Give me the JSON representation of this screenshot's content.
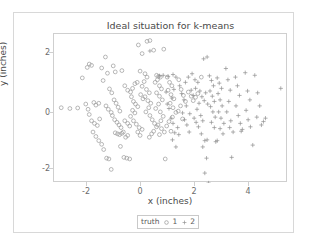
{
  "chart_data": {
    "type": "scatter",
    "title": "Ideal situation for k-means",
    "xlabel": "x (inches)",
    "ylabel": "y (inches)",
    "xlim": [
      -2.6,
      5.5
    ],
    "ylim": [
      -3.0,
      2.7
    ],
    "xticks": [
      -2,
      0,
      2,
      4
    ],
    "xtick_labels": [
      "-2",
      "0",
      "2",
      "4"
    ],
    "yticks": [
      -2,
      0,
      2
    ],
    "ytick_labels": [
      "-2",
      "0",
      "2"
    ],
    "grid": false,
    "legend": {
      "title": "truth",
      "position": "bottom",
      "entries": [
        {
          "label": "1",
          "marker": "open-circle",
          "color": "#8a8a8a"
        },
        {
          "label": "2",
          "marker": "plus",
          "color": "#8a8a8a"
        }
      ]
    },
    "series": [
      {
        "name": "1",
        "marker": "open-circle",
        "color": "#9a9a9a",
        "points": [
          [
            -2.35,
            -0.12
          ],
          [
            -2.05,
            -0.15
          ],
          [
            -1.78,
            -0.13
          ],
          [
            -1.62,
            1.02
          ],
          [
            -1.45,
            1.42
          ],
          [
            -1.38,
            1.55
          ],
          [
            -1.3,
            1.5
          ],
          [
            -1.22,
            0.08
          ],
          [
            -1.15,
            -0.02
          ],
          [
            -1.05,
            0.05
          ],
          [
            -1.38,
            -0.38
          ],
          [
            -1.3,
            -0.62
          ],
          [
            -1.2,
            -0.72
          ],
          [
            -1.1,
            -0.8
          ],
          [
            -1.02,
            -0.55
          ],
          [
            -1.25,
            -1.05
          ],
          [
            -1.15,
            -1.22
          ],
          [
            -1.05,
            -1.38
          ],
          [
            -0.95,
            -1.52
          ],
          [
            -0.88,
            -1.72
          ],
          [
            -0.78,
            -2.05
          ],
          [
            -0.7,
            -2.08
          ],
          [
            -0.62,
            -2.48
          ],
          [
            -0.95,
            1.4
          ],
          [
            -0.82,
            1.82
          ],
          [
            -0.75,
            1.2
          ],
          [
            -0.68,
            0.6
          ],
          [
            -0.6,
            0.45
          ],
          [
            -0.52,
            0.18
          ],
          [
            -0.45,
            0.05
          ],
          [
            -0.38,
            -0.1
          ],
          [
            -0.32,
            -0.25
          ],
          [
            -0.58,
            -0.42
          ],
          [
            -0.5,
            -0.58
          ],
          [
            -0.42,
            -0.68
          ],
          [
            -0.35,
            -0.78
          ],
          [
            -0.28,
            -0.88
          ],
          [
            -0.48,
            -1.08
          ],
          [
            -0.4,
            -1.12
          ],
          [
            -0.33,
            -1.15
          ],
          [
            -0.25,
            -1.1
          ],
          [
            -0.2,
            -1.05
          ],
          [
            -0.3,
            -1.6
          ],
          [
            -0.18,
            -2.02
          ],
          [
            -0.08,
            -2.05
          ],
          [
            0.02,
            -2.08
          ],
          [
            -0.25,
            1.3
          ],
          [
            -0.15,
            0.72
          ],
          [
            -0.05,
            0.55
          ],
          [
            0.05,
            0.48
          ],
          [
            0.12,
            0.62
          ],
          [
            0.2,
            0.8
          ],
          [
            0.28,
            0.85
          ],
          [
            0.08,
            0.3
          ],
          [
            0.15,
            0.12
          ],
          [
            0.22,
            0.02
          ],
          [
            0.3,
            -0.08
          ],
          [
            0.12,
            -0.22
          ],
          [
            0.2,
            -0.32
          ],
          [
            0.05,
            -0.45
          ],
          [
            0.15,
            -0.62
          ],
          [
            0.25,
            -0.75
          ],
          [
            0.35,
            -0.88
          ],
          [
            0.3,
            -1.05
          ],
          [
            0.38,
            -1.18
          ],
          [
            0.45,
            -0.95
          ],
          [
            0.32,
            2.28
          ],
          [
            0.45,
            1.95
          ],
          [
            0.55,
            1.18
          ],
          [
            0.62,
            1.05
          ],
          [
            0.52,
            0.88
          ],
          [
            0.45,
            0.7
          ],
          [
            0.6,
            0.58
          ],
          [
            0.7,
            0.45
          ],
          [
            0.55,
            0.3
          ],
          [
            0.65,
            0.15
          ],
          [
            0.75,
            0.05
          ],
          [
            0.68,
            -0.12
          ],
          [
            0.58,
            -0.28
          ],
          [
            0.72,
            -0.42
          ],
          [
            0.8,
            -0.58
          ],
          [
            0.88,
            -0.72
          ],
          [
            0.95,
            -0.85
          ],
          [
            0.85,
            -1.02
          ],
          [
            0.78,
            -1.12
          ],
          [
            0.7,
            -1.25
          ],
          [
            0.62,
            2.42
          ],
          [
            0.72,
            2.45
          ],
          [
            0.85,
            2.08
          ],
          [
            0.95,
            1.12
          ],
          [
            1.02,
            1.08
          ],
          [
            1.08,
            1.05
          ],
          [
            0.98,
            0.95
          ],
          [
            0.9,
            0.85
          ],
          [
            1.05,
            0.72
          ],
          [
            1.12,
            0.6
          ],
          [
            0.95,
            0.45
          ],
          [
            1.05,
            0.32
          ],
          [
            1.15,
            0.18
          ],
          [
            1.02,
            0.02
          ],
          [
            0.92,
            -0.15
          ],
          [
            1.08,
            -0.28
          ],
          [
            1.18,
            -0.45
          ],
          [
            1.1,
            -0.62
          ],
          [
            1.0,
            -0.78
          ],
          [
            1.12,
            -0.92
          ],
          [
            1.22,
            -1.05
          ],
          [
            1.05,
            -1.15
          ],
          [
            1.2,
            2.12
          ],
          [
            1.32,
            1.05
          ],
          [
            1.4,
            0.85
          ],
          [
            1.48,
            0.72
          ],
          [
            1.35,
            0.55
          ],
          [
            1.45,
            0.38
          ],
          [
            1.55,
            0.22
          ],
          [
            1.42,
            0.05
          ],
          [
            1.52,
            -0.12
          ],
          [
            1.62,
            -0.3
          ],
          [
            1.5,
            -0.48
          ],
          [
            1.38,
            -0.65
          ],
          [
            1.3,
            -0.82
          ],
          [
            1.45,
            -1.02
          ],
          [
            1.25,
            -2.08
          ],
          [
            1.72,
            0.95
          ],
          [
            1.8,
            0.58
          ],
          [
            1.88,
            0.35
          ],
          [
            1.95,
            0.12
          ],
          [
            1.78,
            -0.05
          ],
          [
            1.7,
            -0.25
          ],
          [
            1.85,
            -0.55
          ],
          [
            2.05,
            0.48
          ],
          [
            2.15,
            0.32
          ],
          [
            2.22,
            0.15
          ],
          [
            2.3,
            0.28
          ],
          [
            2.38,
            0.42
          ],
          [
            2.5,
            1.05
          ],
          [
            -1.5,
            0.02
          ],
          [
            -1.42,
            -0.18
          ],
          [
            -0.9,
            0.92
          ],
          [
            -0.8,
            -0.05
          ],
          [
            -0.72,
            -0.18
          ],
          [
            -0.62,
            -0.3
          ],
          [
            -0.55,
            1.48
          ],
          [
            -0.48,
            1.25
          ],
          [
            0.4,
            0.38
          ],
          [
            0.48,
            0.22
          ],
          [
            0.38,
            1.28
          ],
          [
            -0.15,
            -0.62
          ],
          [
            -0.05,
            -0.72
          ],
          [
            0.02,
            -0.82
          ],
          [
            -0.12,
            -1.25
          ],
          [
            -0.05,
            -1.18
          ]
        ]
      },
      {
        "name": "2",
        "marker": "plus",
        "color": "#8f8f8f",
        "points": [
          [
            0.72,
            2.05
          ],
          [
            1.05,
            1.1
          ],
          [
            1.18,
            1.12
          ],
          [
            1.35,
            1.08
          ],
          [
            1.52,
            1.15
          ],
          [
            1.62,
            1.05
          ],
          [
            1.55,
            0.58
          ],
          [
            1.48,
            0.25
          ],
          [
            1.38,
            -0.15
          ],
          [
            1.45,
            -0.52
          ],
          [
            1.52,
            -0.72
          ],
          [
            1.58,
            -1.08
          ],
          [
            1.5,
            -1.35
          ],
          [
            1.62,
            -1.62
          ],
          [
            1.75,
            0.72
          ],
          [
            1.82,
            0.42
          ],
          [
            1.9,
            0.18
          ],
          [
            1.98,
            -0.05
          ],
          [
            1.85,
            -0.32
          ],
          [
            1.92,
            -0.58
          ],
          [
            2.0,
            -0.78
          ],
          [
            2.08,
            -1.05
          ],
          [
            2.15,
            0.55
          ],
          [
            2.22,
            0.35
          ],
          [
            2.3,
            0.62
          ],
          [
            2.38,
            0.85
          ],
          [
            2.45,
            0.52
          ],
          [
            2.52,
            0.3
          ],
          [
            2.42,
            0.05
          ],
          [
            2.35,
            -0.18
          ],
          [
            2.48,
            -0.42
          ],
          [
            2.55,
            -0.62
          ],
          [
            2.4,
            -0.85
          ],
          [
            2.5,
            -1.12
          ],
          [
            2.62,
            -1.38
          ],
          [
            2.7,
            -1.35
          ],
          [
            2.55,
            -1.62
          ],
          [
            2.68,
            -2.05
          ],
          [
            2.62,
            -2.62
          ],
          [
            2.75,
            -3.0
          ],
          [
            2.58,
            1.75
          ],
          [
            2.7,
            1.82
          ],
          [
            2.78,
            1.1
          ],
          [
            2.85,
            0.92
          ],
          [
            2.92,
            0.72
          ],
          [
            2.8,
            0.52
          ],
          [
            2.88,
            0.32
          ],
          [
            2.95,
            0.12
          ],
          [
            2.82,
            -0.08
          ],
          [
            2.9,
            -0.28
          ],
          [
            2.98,
            -0.48
          ],
          [
            2.85,
            -0.68
          ],
          [
            2.95,
            -0.88
          ],
          [
            3.05,
            1.02
          ],
          [
            3.12,
            0.82
          ],
          [
            3.2,
            0.62
          ],
          [
            3.08,
            0.42
          ],
          [
            3.15,
            0.18
          ],
          [
            3.22,
            -0.05
          ],
          [
            3.1,
            -0.28
          ],
          [
            3.18,
            -0.52
          ],
          [
            3.28,
            -0.72
          ],
          [
            3.15,
            -0.92
          ],
          [
            3.25,
            -1.12
          ],
          [
            3.35,
            1.38
          ],
          [
            3.42,
            0.95
          ],
          [
            3.5,
            0.55
          ],
          [
            3.45,
            0.12
          ],
          [
            3.38,
            -0.28
          ],
          [
            3.52,
            -0.62
          ],
          [
            3.48,
            -0.88
          ],
          [
            3.6,
            -1.05
          ],
          [
            3.55,
            -2.02
          ],
          [
            3.68,
            1.05
          ],
          [
            3.75,
            0.72
          ],
          [
            3.82,
            0.35
          ],
          [
            3.7,
            -0.05
          ],
          [
            3.78,
            -0.42
          ],
          [
            3.85,
            -0.72
          ],
          [
            3.92,
            -0.95
          ],
          [
            3.88,
            -1.02
          ],
          [
            4.02,
            1.22
          ],
          [
            4.1,
            0.52
          ],
          [
            4.18,
            0.18
          ],
          [
            4.05,
            -0.22
          ],
          [
            4.12,
            -0.58
          ],
          [
            4.2,
            -0.85
          ],
          [
            4.28,
            -1.55
          ],
          [
            4.35,
            1.12
          ],
          [
            4.45,
            0.45
          ],
          [
            4.52,
            -0.05
          ],
          [
            4.42,
            -0.48
          ],
          [
            4.58,
            -0.78
          ],
          [
            4.65,
            -0.65
          ],
          [
            4.72,
            -0.52
          ],
          [
            5.25,
            0.62
          ],
          [
            2.05,
            1.05
          ],
          [
            2.18,
            1.18
          ],
          [
            2.28,
            0.95
          ],
          [
            1.95,
            0.85
          ],
          [
            2.1,
            -0.35
          ],
          [
            2.25,
            -0.52
          ],
          [
            2.32,
            -0.68
          ],
          [
            2.6,
            0.15
          ],
          [
            2.72,
            0.02
          ],
          [
            2.65,
            0.45
          ],
          [
            3.0,
            -1.42
          ],
          [
            3.05,
            -1.38
          ],
          [
            1.68,
            -0.88
          ],
          [
            1.72,
            -1.15
          ],
          [
            1.28,
            0.48
          ],
          [
            1.32,
            0.02
          ]
        ]
      }
    ]
  }
}
